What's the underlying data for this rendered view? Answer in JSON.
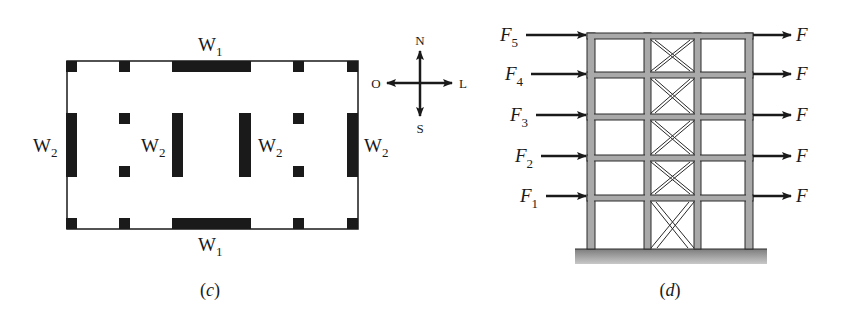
{
  "panels": [
    {
      "id": "c",
      "caption": "(c)",
      "caption_letter": "c",
      "title": "Floor plan with shear walls",
      "walls": {
        "top": {
          "label": "W",
          "sub": "1"
        },
        "bottom": {
          "label": "W",
          "sub": "1"
        },
        "left": {
          "label": "W",
          "sub": "2"
        },
        "inner_left": {
          "label": "W",
          "sub": "2"
        },
        "inner_right": {
          "label": "W",
          "sub": "2"
        },
        "right": {
          "label": "W",
          "sub": "2"
        }
      },
      "compass": {
        "north": "N",
        "south": "S",
        "west": "O",
        "east": "L"
      }
    },
    {
      "id": "d",
      "caption": "(d)",
      "caption_letter": "d",
      "title": "Braced frame elevation with lateral forces",
      "left_forces": [
        {
          "label": "F",
          "sub": "5"
        },
        {
          "label": "F",
          "sub": "4"
        },
        {
          "label": "F",
          "sub": "3"
        },
        {
          "label": "F",
          "sub": "2"
        },
        {
          "label": "F",
          "sub": "1"
        }
      ],
      "right_forces": [
        {
          "label": "F"
        },
        {
          "label": "F"
        },
        {
          "label": "F"
        },
        {
          "label": "F"
        },
        {
          "label": "F"
        }
      ],
      "colors": {
        "member_fill": "#a9a9a9",
        "member_stroke": "#2a2a2a",
        "ground": "#8c8c8c"
      }
    }
  ]
}
